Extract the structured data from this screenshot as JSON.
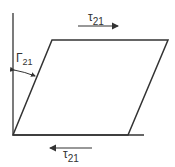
{
  "diagram": {
    "type": "shear-deformation",
    "colors": {
      "stroke": "#333333",
      "background": "#ffffff"
    },
    "labels": {
      "top_shear": {
        "symbol": "τ",
        "subscript": "21"
      },
      "bottom_shear": {
        "symbol": "τ",
        "subscript": "21"
      },
      "shear_angle": {
        "symbol": "Γ",
        "subscript": "21"
      }
    },
    "arrows": {
      "top": {
        "direction": "right"
      },
      "bottom": {
        "direction": "left"
      }
    }
  }
}
